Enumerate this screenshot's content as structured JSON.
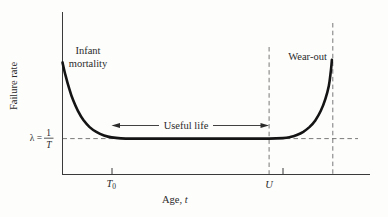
{
  "figure": {
    "y_axis_label": "Failure rate",
    "x_axis_label": {
      "prefix": "Age, ",
      "variable": "t"
    },
    "region_labels": {
      "infant_line1": "Infant",
      "infant_line2": "mortality",
      "useful_life": "Useful life",
      "wear_out": "Wear-out"
    },
    "lambda_annotation": {
      "lhs": "λ =",
      "numerator": "1",
      "denominator": "T"
    },
    "x_ticks": {
      "t0_base": "T",
      "t0_subscript": "0",
      "u": "U"
    }
  },
  "colors": {
    "background": "#fdfdfc",
    "axis": "#3a3a3a",
    "dashed_guides": "#6a6a6a",
    "curve": "#141414",
    "text": "#2b2b2b"
  },
  "chart_data": {
    "type": "line",
    "title": "",
    "xlabel": "Age, t",
    "ylabel": "Failure rate",
    "axes_numeric": false,
    "x_tick_labels": [
      "T₀",
      "U"
    ],
    "y_tick_labels": [
      "λ = 1/T"
    ],
    "annotations": [
      "Infant mortality",
      "Useful life",
      "Wear-out"
    ],
    "legend": false,
    "grid": false,
    "series": [
      {
        "name": "failure rate (bathtub curve)",
        "x_norm": [
          0,
          0.01,
          0.022,
          0.035,
          0.05,
          0.068,
          0.088,
          0.11,
          0.135,
          0.16,
          0.19,
          0.23,
          0.3,
          0.4,
          0.5,
          0.6,
          0.672,
          0.717,
          0.74,
          0.762,
          0.783,
          0.803,
          0.822,
          0.84,
          0.855,
          0.866,
          0.872,
          0.876
        ],
        "y_norm": [
          0.69,
          0.608,
          0.527,
          0.455,
          0.392,
          0.335,
          0.292,
          0.262,
          0.24,
          0.228,
          0.222,
          0.221,
          0.221,
          0.221,
          0.221,
          0.221,
          0.221,
          0.224,
          0.23,
          0.243,
          0.263,
          0.292,
          0.333,
          0.392,
          0.465,
          0.545,
          0.625,
          0.705
        ]
      }
    ],
    "landmarks": {
      "t0_x_norm": 0.161,
      "u_x_norm": 0.672,
      "extra_tick_x_norm": 0.717,
      "wearout_guide_x_norm": 0.879,
      "lambda_level_y_norm": 0.221
    }
  }
}
